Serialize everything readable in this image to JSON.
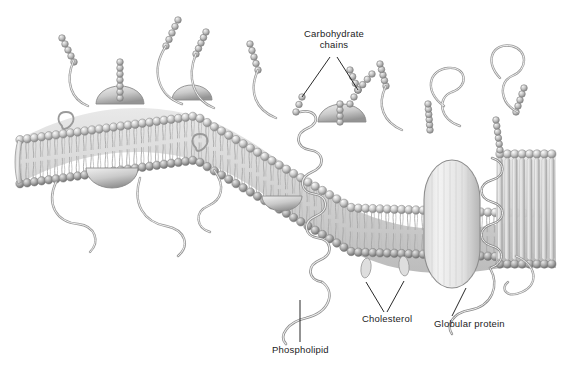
{
  "figure": {
    "background_color": "#ffffff",
    "style": "grayscale pen-and-ink scientific illustration",
    "clipped_text_top": "",
    "labels": [
      {
        "id": "carbohydrate-chains",
        "text": "Carbohydrate chains",
        "line1": "Carbohydrate",
        "line2": "chains",
        "x": 334,
        "y": 33,
        "leader": "two-line-fork"
      },
      {
        "id": "cholesterol",
        "text": "Cholesterol",
        "x": 362,
        "y": 318,
        "leader": "two-line-fork"
      },
      {
        "id": "phospholipid",
        "text": "Phospholipid",
        "x": 272,
        "y": 349,
        "leader": "single-line"
      },
      {
        "id": "globular-protein",
        "text": "Globular protein",
        "x": 434,
        "y": 323,
        "leader": "single-line"
      }
    ],
    "structures": [
      {
        "name": "phospholipid-bilayer",
        "description": "two leaflets of round head groups with fatty acid tails"
      },
      {
        "name": "globular-protein",
        "description": "large integral oval protein spanning the bilayer"
      },
      {
        "name": "coiled-protein",
        "description": "alpha-helical coiled transmembrane protein"
      },
      {
        "name": "peripheral-protein-dome",
        "description": "dome shaped proteins on membrane surfaces"
      },
      {
        "name": "carbohydrate-bead-chain",
        "description": "branched strings of beads projecting from outer surface"
      }
    ],
    "palette": {
      "ink": "#3f3f3f",
      "label_text": "#1c1c1c",
      "leader_line": "#111111",
      "head_light": "#f2f2f2",
      "head_mid": "#b9b9b9",
      "head_dark": "#7f7f7f",
      "tail": "#d6d6d6",
      "tail_shadow": "#9a9a9a",
      "protein_light": "#ededed",
      "protein_mid": "#c4c4c4",
      "background": "#ffffff"
    }
  }
}
